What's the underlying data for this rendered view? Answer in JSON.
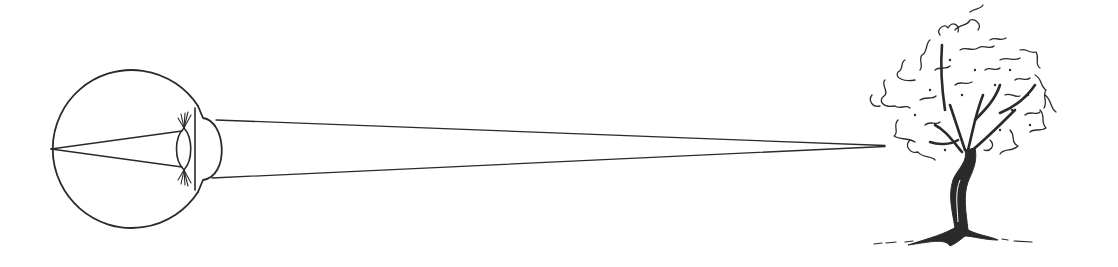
{
  "diagram": {
    "type": "illustration",
    "background": "#ffffff",
    "ink_color": "#2a2a2a",
    "elements": [
      {
        "id": "eye",
        "kind": "eyeball-cross-section",
        "center": [
          131,
          149
        ],
        "radius": 79
      },
      {
        "id": "lens",
        "kind": "biconvex-lens",
        "center": [
          184,
          149
        ]
      },
      {
        "id": "cornea",
        "kind": "cornea-bulge",
        "apex_x": 226
      },
      {
        "id": "retina-rays",
        "kind": "internal-rays",
        "from": [
          50,
          149
        ],
        "to": [
          [
            180,
            131
          ],
          [
            180,
            167
          ]
        ]
      },
      {
        "id": "sight-rays",
        "kind": "converging-lines",
        "from": [
          [
            215,
            120
          ],
          [
            212,
            178
          ]
        ],
        "to": [
          885,
          146
        ]
      },
      {
        "id": "tree",
        "kind": "sketch-tree",
        "bbox": [
          868,
          2,
          1065,
          247
        ]
      }
    ],
    "labels": []
  }
}
